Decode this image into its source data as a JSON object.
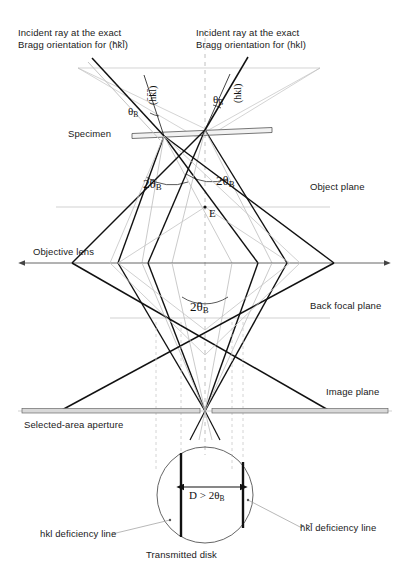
{
  "figure": {
    "background": "#ffffff",
    "ink": "#111111",
    "faint": "#b9b9b9"
  },
  "labels": {
    "incident_left": "Incident ray at the exact\nBragg orientation for (h̄k̄l̄)",
    "incident_right": "Incident ray at the exact\nBragg orientation for (hkl)",
    "specimen": "Specimen",
    "object_plane": "Object plane",
    "objective_lens": "Objective lens",
    "back_focal_plane": "Back focal plane",
    "image_plane": "Image plane",
    "selected_area_aperture": "Selected-area aperture",
    "transmitted_disk": "Transmitted disk",
    "deficiency_left": "hkl deficiency line",
    "deficiency_right": "h̄k̄l̄ deficiency line",
    "point_e": "E"
  },
  "plane_labels_rotated": {
    "left_hkl": "(h̄k̄l̄)",
    "right_hkl": "(hkl)"
  },
  "angles": {
    "theta_b_left": "θ",
    "theta_b_right": "θ",
    "theta_sub": "B",
    "two_theta_left": "2θ",
    "two_theta_right": "2θ",
    "two_theta_lens": "2θ"
  },
  "disk": {
    "dimension_text": "D > 2θ",
    "dimension_sub": "B",
    "center_x": 205,
    "center_y": 495,
    "radius": 48,
    "line_left_x": 181,
    "line_right_x": 243
  },
  "geometry": {
    "specimen_y": 130,
    "object_plane_y": 207,
    "objective_lens_y": 263,
    "back_focal_plane_y": 318,
    "image_plane_y": 411,
    "axis_x": 205
  }
}
